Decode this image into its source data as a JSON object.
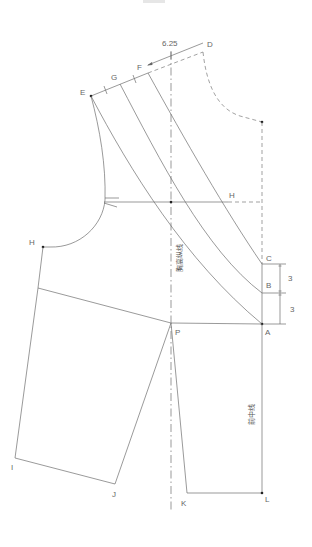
{
  "diagram": {
    "type": "sewing-pattern-front-bodice",
    "line_color": "#6e6e6e",
    "point_color": "#222222",
    "labels": {
      "D": "D",
      "F": "F",
      "G": "G",
      "E": "E",
      "H_right": "H",
      "H_left": "H",
      "C": "C",
      "B": "B",
      "A": "A",
      "P": "P",
      "I": "I",
      "J": "J",
      "K": "K",
      "L": "L"
    },
    "dimensions": {
      "shoulder_offset": "6.25",
      "c_to_b": "3",
      "b_to_a": "3"
    },
    "annotations": {
      "bust_vertical_line": "胸高纵线",
      "center_front_line": "前中线"
    }
  }
}
